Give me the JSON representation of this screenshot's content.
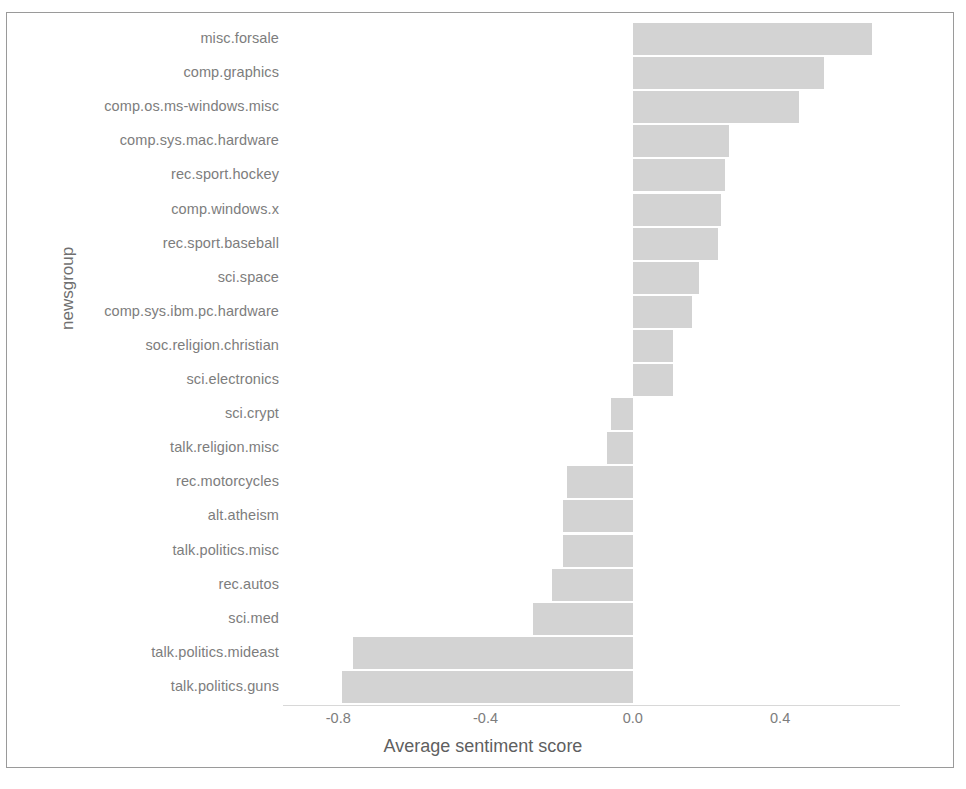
{
  "chart_data": {
    "type": "bar",
    "orientation": "horizontal",
    "title": "",
    "xlabel": "Average sentiment score",
    "ylabel": "newsgroup",
    "xlim": [
      -0.95,
      0.72
    ],
    "xticks": [
      -0.8,
      -0.4,
      0.0,
      0.4
    ],
    "xtick_labels": [
      "-0.8",
      "-0.4",
      "0.0",
      "0.4"
    ],
    "grid": false,
    "legend": "none",
    "bar_color": "#d3d3d3",
    "categories": [
      "misc.forsale",
      "comp.graphics",
      "comp.os.ms-windows.misc",
      "comp.sys.mac.hardware",
      "rec.sport.hockey",
      "comp.windows.x",
      "rec.sport.baseball",
      "sci.space",
      "comp.sys.ibm.pc.hardware",
      "soc.religion.christian",
      "sci.electronics",
      "sci.crypt",
      "talk.religion.misc",
      "rec.motorcycles",
      "alt.atheism",
      "talk.politics.misc",
      "rec.autos",
      "sci.med",
      "talk.politics.mideast",
      "talk.politics.guns"
    ],
    "values": [
      0.65,
      0.52,
      0.45,
      0.26,
      0.25,
      0.24,
      0.23,
      0.18,
      0.16,
      0.11,
      0.11,
      -0.06,
      -0.07,
      -0.18,
      -0.19,
      -0.19,
      -0.22,
      -0.27,
      -0.76,
      -0.79
    ]
  }
}
